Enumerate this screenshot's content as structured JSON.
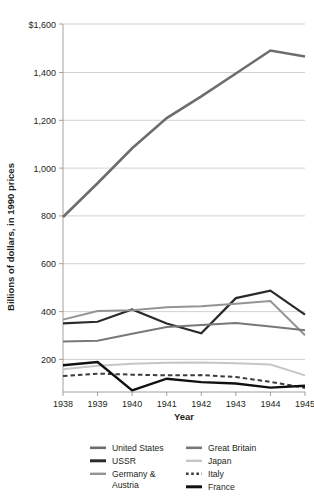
{
  "chart_data": {
    "type": "line",
    "title": "",
    "xlabel": "Year",
    "ylabel": "Billions of dollars, in 1990 prices",
    "categories": [
      "1938",
      "1939",
      "1940",
      "1941",
      "1942",
      "1943",
      "1944",
      "1945"
    ],
    "x": [
      1938,
      1939,
      1940,
      1941,
      1942,
      1943,
      1944,
      1945
    ],
    "ylim": [
      75,
      1600
    ],
    "xlim": [
      1938,
      1945
    ],
    "grid": "horizontal",
    "legend_position": "bottom",
    "ytick_labels": [
      "$1,600",
      "1,400",
      "1,200",
      "1,000",
      "800",
      "600",
      "400",
      "200"
    ],
    "ytick_values": [
      1600,
      1400,
      1200,
      1000,
      800,
      600,
      400,
      200
    ],
    "series": [
      {
        "name": "United States",
        "color": "#6d6d6d",
        "width": 2.6,
        "dash": "none",
        "values": [
          800,
          940,
          1085,
          1210,
          1300,
          1395,
          1490,
          1465
        ]
      },
      {
        "name": "USSR",
        "color": "#2b2b2b",
        "width": 2.2,
        "dash": "none",
        "values": [
          359,
          366,
          417,
          359,
          318,
          464,
          495,
          396
        ]
      },
      {
        "name": "Germany & Austria",
        "color": "#949494",
        "width": 2.0,
        "dash": "none",
        "values": [
          375,
          411,
          414,
          426,
          430,
          441,
          452,
          310
        ]
      },
      {
        "name": "Great Britain",
        "color": "#787878",
        "width": 2.0,
        "dash": "none",
        "values": [
          284,
          287,
          316,
          344,
          353,
          361,
          346,
          331
        ]
      },
      {
        "name": "Japan",
        "color": "#c6c6c6",
        "width": 2.0,
        "dash": "none",
        "values": [
          169,
          184,
          192,
          196,
          197,
          194,
          189,
          144
        ]
      },
      {
        "name": "Italy",
        "color": "#3c3c3c",
        "width": 2.0,
        "dash": "dashed",
        "values": [
          141,
          151,
          147,
          144,
          145,
          137,
          117,
          92
        ]
      },
      {
        "name": "France",
        "color": "#111111",
        "width": 2.4,
        "dash": "none",
        "values": [
          186,
          199,
          82,
          130,
          116,
          110,
          93,
          101
        ]
      }
    ],
    "legend": [
      {
        "label": "United States",
        "color": "#6d6d6d",
        "dash": "none",
        "width": 2.6
      },
      {
        "label": "Great Britain",
        "color": "#787878",
        "dash": "none",
        "width": 2.6
      },
      {
        "label": "USSR",
        "color": "#2b2b2b",
        "dash": "none",
        "width": 3.0
      },
      {
        "label": "Japan",
        "color": "#c6c6c6",
        "dash": "none",
        "width": 2.4
      },
      {
        "label": "Germany & Austria",
        "color": "#949494",
        "dash": "none",
        "width": 2.4
      },
      {
        "label": "Italy",
        "color": "#3c3c3c",
        "dash": "dashed",
        "width": 2.4
      },
      {
        "label": "France",
        "color": "#111111",
        "dash": "none",
        "width": 3.0
      }
    ],
    "legend_rows": [
      {
        "left_label": "United States",
        "right_label": "Great Britain"
      },
      {
        "left_label": "USSR",
        "right_label": "Japan"
      },
      {
        "left_label": "Germany &",
        "right_label": "Italy"
      },
      {
        "left_label": "Austria",
        "right_label": "France"
      }
    ]
  },
  "colors": {
    "background": "#ffffff",
    "text": "#231f20",
    "gridline": "#bfbfbf",
    "axis": "#8c8c8c"
  }
}
